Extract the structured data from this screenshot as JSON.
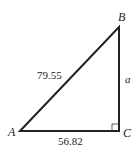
{
  "diagram": {
    "type": "right-triangle",
    "vertices": {
      "A": {
        "label": "A",
        "x": 20,
        "y": 131
      },
      "B": {
        "label": "B",
        "x": 119,
        "y": 27
      },
      "C": {
        "label": "C",
        "x": 119,
        "y": 131
      }
    },
    "sides": {
      "hypotenuse_AB": "79.55",
      "base_AC": "56.82",
      "side_BC": "a"
    },
    "right_angle_at": "C",
    "colors": {
      "stroke": "#222222",
      "background": "#ffffff"
    }
  }
}
